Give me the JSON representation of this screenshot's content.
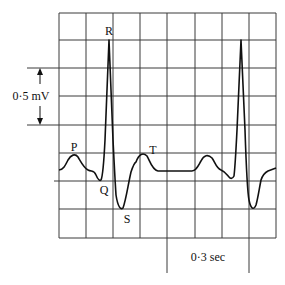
{
  "labels": {
    "p": "P",
    "q": "Q",
    "r": "R",
    "s": "S",
    "t": "T",
    "voltage_scale": "0·5 mV",
    "time_scale": "0·3 sec"
  },
  "scales": {
    "voltage_per_2_boxes_mV": 0.5,
    "time_per_3_boxes_sec": 0.3
  }
}
